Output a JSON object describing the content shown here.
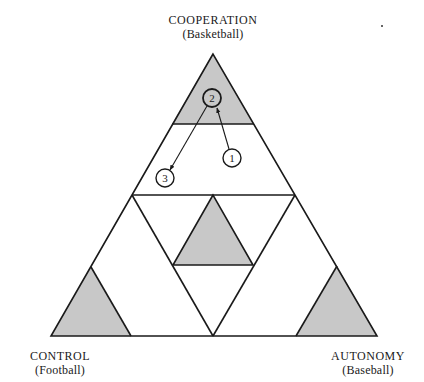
{
  "diagram": {
    "type": "triangle-model",
    "colors": {
      "shade": "#c8c8c8",
      "line": "#1a1a1a",
      "background": "#ffffff"
    },
    "vertices": {
      "top": {
        "title": "COOPERATION",
        "subtitle": "(Basketball)"
      },
      "left": {
        "title": "CONTROL",
        "subtitle": "(Football)"
      },
      "right": {
        "title": "AUTONOMY",
        "subtitle": "(Baseball)"
      }
    },
    "markers": [
      {
        "label": "1"
      },
      {
        "label": "2"
      },
      {
        "label": "3"
      }
    ],
    "arrows": [
      {
        "from": "1",
        "to": "2"
      },
      {
        "from": "2",
        "to": "3"
      }
    ]
  }
}
